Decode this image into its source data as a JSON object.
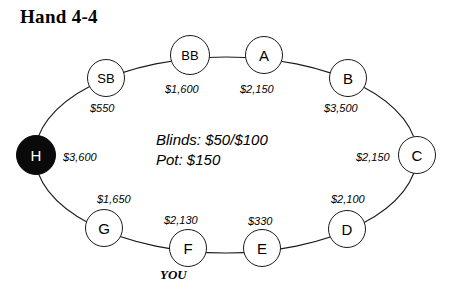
{
  "title": "Hand 4-4",
  "center": {
    "blinds_line": "Blinds: $50/$100",
    "pot_line": "Pot: $150"
  },
  "you_marker": "YOU",
  "table": {
    "shape": "ellipse",
    "line_color": "#1a1a1a"
  },
  "seats": [
    {
      "id": "sb",
      "label": "SB",
      "stack": "$550",
      "cx": 106,
      "cy": 78,
      "r": 19,
      "filled": false,
      "label_size": "small",
      "stack_x": 90,
      "stack_y": 103
    },
    {
      "id": "bb",
      "label": "BB",
      "stack": "$1,600",
      "cx": 190,
      "cy": 55,
      "r": 20,
      "filled": false,
      "label_size": "small",
      "stack_x": 165,
      "stack_y": 84
    },
    {
      "id": "a",
      "label": "A",
      "stack": "$2,150",
      "cx": 264,
      "cy": 55,
      "r": 19,
      "filled": false,
      "label_size": "normal",
      "stack_x": 240,
      "stack_y": 84
    },
    {
      "id": "b",
      "label": "B",
      "stack": "$3,500",
      "cx": 348,
      "cy": 78,
      "r": 19,
      "filled": false,
      "label_size": "normal",
      "stack_x": 324,
      "stack_y": 103
    },
    {
      "id": "c",
      "label": "C",
      "stack": "$2,150",
      "cx": 417,
      "cy": 155,
      "r": 19,
      "filled": false,
      "label_size": "normal",
      "stack_x": 356,
      "stack_y": 152
    },
    {
      "id": "d",
      "label": "D",
      "stack": "$2,100",
      "cx": 347,
      "cy": 229,
      "r": 19,
      "filled": false,
      "label_size": "normal",
      "stack_x": 331,
      "stack_y": 194
    },
    {
      "id": "e",
      "label": "E",
      "stack": "$330",
      "cx": 262,
      "cy": 248,
      "r": 19,
      "filled": false,
      "label_size": "normal",
      "stack_x": 248,
      "stack_y": 216
    },
    {
      "id": "f",
      "label": "F",
      "stack": "$2,130",
      "cx": 188,
      "cy": 248,
      "r": 19,
      "filled": false,
      "label_size": "normal",
      "stack_x": 164,
      "stack_y": 215
    },
    {
      "id": "g",
      "label": "G",
      "stack": "$1,650",
      "cx": 104,
      "cy": 228,
      "r": 19,
      "filled": false,
      "label_size": "normal",
      "stack_x": 97,
      "stack_y": 194
    },
    {
      "id": "h",
      "label": "H",
      "stack": "$3,600",
      "cx": 36,
      "cy": 155,
      "r": 20,
      "filled": true,
      "label_size": "normal",
      "stack_x": 63,
      "stack_y": 152
    }
  ]
}
